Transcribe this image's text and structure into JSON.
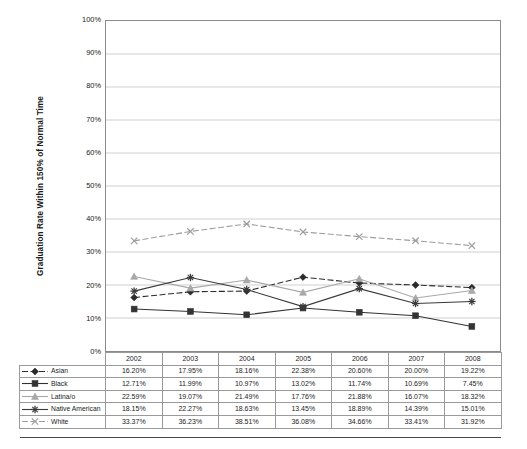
{
  "chart_data": {
    "type": "line",
    "title": "",
    "subtitle": "",
    "xlabel": "",
    "ylabel": "Graduation Rate Within 150% of Normal Time",
    "ylim": [
      0,
      100
    ],
    "ytick_labels": [
      "100%",
      "90%",
      "80%",
      "70%",
      "60%",
      "50%",
      "40%",
      "30%",
      "20%",
      "10%",
      "0%"
    ],
    "ytick_values": [
      100,
      90,
      80,
      70,
      60,
      50,
      40,
      30,
      20,
      10,
      0
    ],
    "grid": "horizontal",
    "legend_position": "table-left",
    "categories": [
      "2002",
      "2003",
      "2004",
      "2005",
      "2006",
      "2007",
      "2008"
    ],
    "series": [
      {
        "name": "Asian",
        "values": [
          16.2,
          17.95,
          18.16,
          22.38,
          20.6,
          20.0,
          19.22
        ],
        "labels": [
          "16.20%",
          "17.95%",
          "18.16%",
          "22.38%",
          "20.60%",
          "20.00%",
          "19.22%"
        ],
        "color": "#2b2b2b",
        "marker": "diamond",
        "line_style": "dash-dot"
      },
      {
        "name": "Black",
        "values": [
          12.71,
          11.99,
          10.97,
          13.02,
          11.74,
          10.69,
          7.45
        ],
        "labels": [
          "12.71%",
          "11.99%",
          "10.97%",
          "13.02%",
          "11.74%",
          "10.69%",
          "7.45%"
        ],
        "color": "#333333",
        "marker": "square",
        "line_style": "solid"
      },
      {
        "name": "Latina/o",
        "values": [
          22.59,
          19.07,
          21.49,
          17.76,
          21.88,
          16.07,
          18.32
        ],
        "labels": [
          "22.59%",
          "19.07%",
          "21.49%",
          "17.76%",
          "21.88%",
          "16.07%",
          "18.32%"
        ],
        "color": "#a8a8a8",
        "marker": "triangle",
        "line_style": "solid"
      },
      {
        "name": "Native American",
        "values": [
          18.15,
          22.27,
          18.63,
          13.45,
          18.89,
          14.39,
          15.01
        ],
        "labels": [
          "18.15%",
          "22.27%",
          "18.63%",
          "13.45%",
          "18.89%",
          "14.39%",
          "15.01%"
        ],
        "color": "#3a3a3a",
        "marker": "cross",
        "line_style": "solid"
      },
      {
        "name": "White",
        "values": [
          33.37,
          36.23,
          38.51,
          36.08,
          34.66,
          33.41,
          31.92
        ],
        "labels": [
          "33.37%",
          "36.23%",
          "38.51%",
          "36.08%",
          "34.66%",
          "33.41%",
          "31.92%"
        ],
        "color": "#9d9d9d",
        "marker": "x",
        "line_style": "dash-dot"
      }
    ]
  },
  "table": {
    "corner_label": "",
    "column_headers": [
      "2002",
      "2003",
      "2004",
      "2005",
      "2006",
      "2007",
      "2008"
    ],
    "rows": [
      {
        "label": "Asian",
        "cells": [
          "16.20%",
          "17.95%",
          "18.16%",
          "22.38%",
          "20.60%",
          "20.00%",
          "19.22%"
        ]
      },
      {
        "label": "Black",
        "cells": [
          "12.71%",
          "11.99%",
          "10.97%",
          "13.02%",
          "11.74%",
          "10.69%",
          "7.45%"
        ]
      },
      {
        "label": "Latina/o",
        "cells": [
          "22.59%",
          "19.07%",
          "21.49%",
          "17.76%",
          "21.88%",
          "16.07%",
          "18.32%"
        ]
      },
      {
        "label": "Native American",
        "cells": [
          "18.15%",
          "22.27%",
          "18.63%",
          "13.45%",
          "18.89%",
          "14.39%",
          "15.01%"
        ]
      },
      {
        "label": "White",
        "cells": [
          "33.37%",
          "36.23%",
          "38.51%",
          "36.08%",
          "34.66%",
          "33.41%",
          "31.92%"
        ]
      }
    ]
  },
  "colors": {
    "axis": "#8a8a8a",
    "grid": "#c9c9c9",
    "text": "#1c1c1c",
    "dark_series": "#2b2b2b",
    "light_series": "#a8a8a8"
  }
}
